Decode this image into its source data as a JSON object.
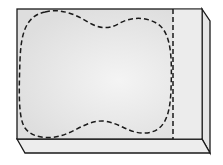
{
  "diagram": {
    "colors": {
      "background": "#ffffff",
      "front_face": "#e4e4e4",
      "front_face_light": "#f2f2f2",
      "side_face": "#e8e8e8",
      "bottom_face": "#ececec",
      "stroke": "#1a1a1a"
    },
    "shapes": [
      "front-face",
      "right-side-face",
      "bottom-face",
      "dashed-blob-outline",
      "dashed-vertical-line"
    ]
  }
}
